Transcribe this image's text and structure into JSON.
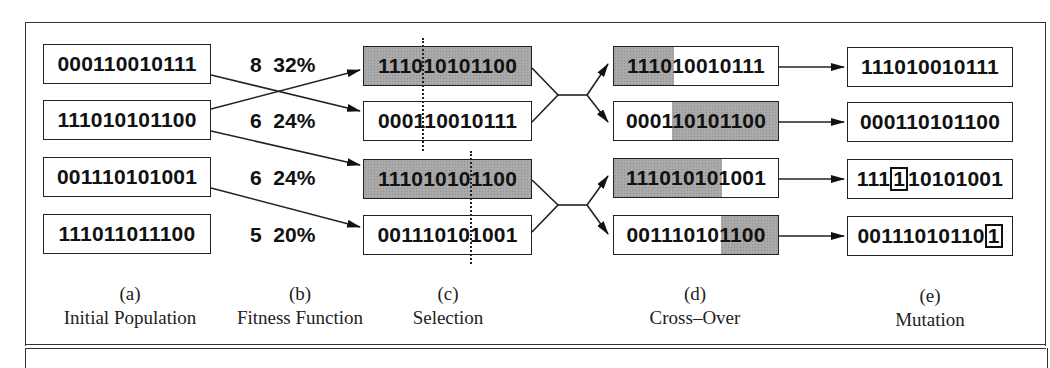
{
  "diagram": {
    "initial_population": [
      "000110010111",
      "111010101100",
      "001110101001",
      "111011011100"
    ],
    "fitness": [
      {
        "score": "8",
        "percent": "32%"
      },
      {
        "score": "6",
        "percent": "24%"
      },
      {
        "score": "6",
        "percent": "24%"
      },
      {
        "score": "5",
        "percent": "20%"
      }
    ],
    "selection": [
      "111010101100",
      "000110010111",
      "111010101100",
      "001110101001"
    ],
    "crossover": [
      "111010010111",
      "000110101100",
      "111010101001",
      "001110101100"
    ],
    "mutation": [
      {
        "before": "111",
        "flipped": "1",
        "after": "10101001"
      },
      {
        "before": "000110101100",
        "flipped": "",
        "after": ""
      },
      {
        "before": "",
        "flipped": "",
        "after": ""
      },
      {
        "before": "00111010110",
        "flipped": "1",
        "after": ""
      }
    ],
    "mutation_plain": [
      "111010010111",
      "000110101100"
    ],
    "labels": [
      {
        "letter": "(a)",
        "name": "Initial Population"
      },
      {
        "letter": "(b)",
        "name": "Fitness Function"
      },
      {
        "letter": "(c)",
        "name": "Selection"
      },
      {
        "letter": "(d)",
        "name": "Cross–Over"
      },
      {
        "letter": "(e)",
        "name": "Mutation"
      }
    ],
    "colors": {
      "shade": "#a9a9a9",
      "line": "#222222",
      "background": "#ffffff"
    }
  }
}
